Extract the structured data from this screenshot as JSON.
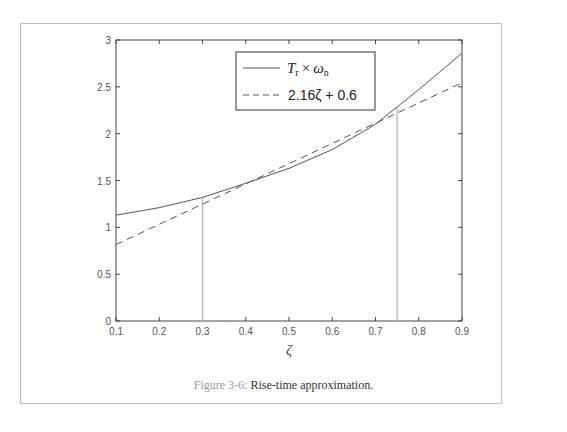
{
  "chart_data": {
    "type": "line",
    "title": "",
    "xlabel": "ζ",
    "ylabel": "",
    "xlim": [
      0.1,
      0.9
    ],
    "ylim": [
      0,
      3
    ],
    "x_ticks": [
      "0.1",
      "0.2",
      "0.3",
      "0.4",
      "0.5",
      "0.6",
      "0.7",
      "0.8",
      "0.9"
    ],
    "y_ticks": [
      "0",
      "0.5",
      "1",
      "1.5",
      "2",
      "2.5",
      "3"
    ],
    "grid": false,
    "legend_position": "upper center",
    "x": [
      0.1,
      0.2,
      0.3,
      0.4,
      0.5,
      0.6,
      0.7,
      0.8,
      0.9
    ],
    "series": [
      {
        "name": "T_r × ω_n",
        "style": "solid",
        "values": [
          1.13,
          1.21,
          1.32,
          1.47,
          1.63,
          1.83,
          2.1,
          2.47,
          2.86
        ]
      },
      {
        "name": "2.16ζ + 0.6",
        "style": "dashed",
        "values": [
          0.816,
          1.032,
          1.248,
          1.464,
          1.68,
          1.896,
          2.112,
          2.328,
          2.544
        ]
      }
    ],
    "annotations": [
      {
        "type": "vertical-line",
        "x": 0.3,
        "y_top": 1.32
      },
      {
        "type": "vertical-line",
        "x": 0.75,
        "y_top": 2.28
      }
    ]
  },
  "legend": {
    "solid_main": "T",
    "solid_sub": "r",
    "solid_times": "×",
    "solid_omega": "ω",
    "solid_omega_sub": "n",
    "dashed_label": "2.16ζ + 0.6"
  },
  "caption": {
    "figure_label": "Figure 3-6:",
    "text": " Rise-time approximation."
  }
}
